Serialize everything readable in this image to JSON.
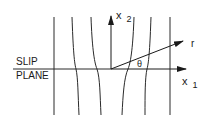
{
  "diagram": {
    "labels": {
      "slip": "SLIP",
      "plane": "PLANE",
      "x2": "x",
      "x2_sub": "2",
      "x1": "x",
      "x1_sub": "1",
      "r": "r",
      "theta": "θ"
    },
    "colors": {
      "stroke": "#2a2a2a",
      "background": "#ffffff"
    },
    "lattice_lines": [
      {
        "name": "lattice-line-1",
        "d": "M54,17 L54,115"
      },
      {
        "name": "lattice-line-2",
        "d": "M72,17 C73,45 74,62 76,69 C78,78 78,95 79,115"
      },
      {
        "name": "lattice-line-3",
        "d": "M91,17 C92,45 94,62 97,69 C100,78 100,95 101,115"
      },
      {
        "name": "lattice-line-4",
        "d": "M134,17 C133,45 131,62 128,69 C124,78 123,95 122,115"
      },
      {
        "name": "lattice-line-5",
        "d": "M151,17 C150,45 149,62 147,69 C145,78 145,95 145,115"
      },
      {
        "name": "lattice-line-6",
        "d": "M170,17 L170,115"
      }
    ]
  }
}
